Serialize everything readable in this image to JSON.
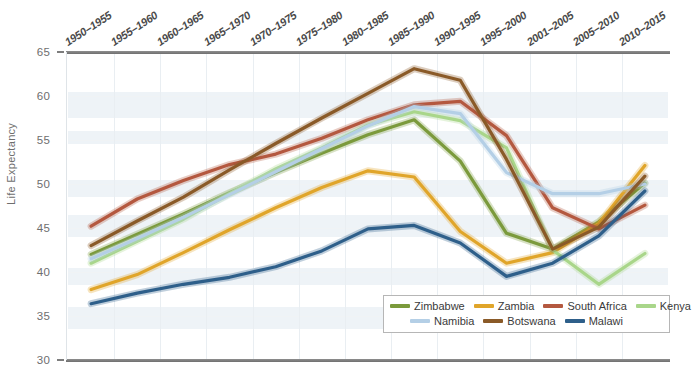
{
  "chart_data": {
    "type": "line",
    "title": "",
    "xlabel": "",
    "ylabel": "Life Expectancy",
    "ylim": [
      30,
      65
    ],
    "ytick_step": 5,
    "yticks": [
      65,
      60,
      55,
      50,
      45,
      40,
      35,
      30
    ],
    "grid": true,
    "legend_position": "bottom-right",
    "categories": [
      "1950–1955",
      "1955–1960",
      "1960–1965",
      "1965–1970",
      "1970–1975",
      "1975–1980",
      "1980–1985",
      "1985–1990",
      "1990–1995",
      "1995–2000",
      "2001–2005",
      "2005–2010",
      "2010–2015"
    ],
    "series": [
      {
        "name": "Zimbabwe",
        "color": "#7b9a3c",
        "values": [
          42.0,
          44.3,
          46.6,
          49.0,
          51.3,
          53.5,
          55.6,
          57.3,
          52.6,
          44.4,
          42.6,
          45.7,
          50.1
        ]
      },
      {
        "name": "Zambia",
        "color": "#e0a52a",
        "values": [
          38.0,
          39.7,
          42.2,
          44.8,
          47.3,
          49.6,
          51.5,
          50.8,
          44.6,
          41.0,
          42.2,
          45.5,
          52.1
        ]
      },
      {
        "name": "South Africa",
        "color": "#b4583f",
        "values": [
          45.2,
          48.3,
          50.4,
          52.2,
          53.4,
          55.2,
          57.3,
          59.0,
          59.4,
          55.5,
          47.3,
          44.9,
          47.6
        ]
      },
      {
        "name": "Kenya",
        "color": "#a9d68a",
        "values": [
          41.0,
          43.5,
          46.0,
          48.9,
          51.7,
          54.1,
          56.7,
          58.2,
          57.2,
          54.1,
          42.5,
          38.6,
          42.1
        ]
      },
      {
        "name": "Namibia",
        "color": "#b4cfe6",
        "values": [
          41.5,
          43.8,
          46.2,
          48.8,
          51.4,
          54.0,
          56.6,
          58.8,
          58.0,
          51.3,
          48.9,
          48.9,
          50.0
        ]
      },
      {
        "name": "Botswana",
        "color": "#8a5a28",
        "values": [
          43.0,
          45.8,
          48.5,
          51.6,
          54.6,
          57.5,
          60.3,
          63.1,
          61.8,
          52.8,
          42.6,
          45.1,
          50.9
        ]
      },
      {
        "name": "Malawi",
        "color": "#2e5f8a",
        "values": [
          36.4,
          37.6,
          38.6,
          39.4,
          40.6,
          42.4,
          44.9,
          45.3,
          43.3,
          39.5,
          41.0,
          44.1,
          49.2
        ]
      }
    ]
  },
  "axis": {
    "y_title": "Life Expectancy",
    "y_labels": [
      "65",
      "60",
      "55",
      "50",
      "45",
      "40",
      "35",
      "30"
    ]
  },
  "legend": {
    "row1": [
      "Zimbabwe",
      "Zambia",
      "South Africa",
      "Kenya"
    ],
    "row2": [
      "Namibia",
      "Botswana",
      "Malawi"
    ]
  }
}
